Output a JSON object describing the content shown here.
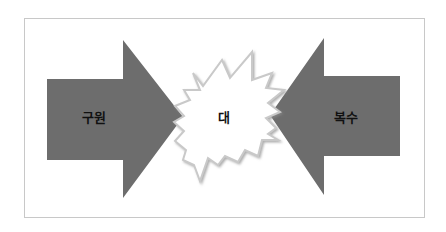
{
  "diagram": {
    "colors": {
      "arrow_fill": "#6d6d6d",
      "burst_fill": "#ffffff",
      "burst_stroke": "#c9c9c9",
      "burst_shadow": "#9a9a9a",
      "frame_border": "#c8c8c8",
      "text": "#111111"
    },
    "left_arrow": {
      "label": "구원",
      "direction": "right",
      "points": "47,79 123,79 123,40 183,117 123,198 123,160 47,160"
    },
    "right_arrow": {
      "label": "복수",
      "direction": "left",
      "points": "400,76 324,76 324,38 270,115 324,195 324,156 400,156"
    },
    "center_burst": {
      "label": "대",
      "points": "193,73 203,86 222,60 230,78 252,52 252,80 272,73 266,88 284,90 268,103 280,112 266,118 276,128 268,134 278,140 262,140 258,156 245,150 238,162 225,156 218,165 208,158 200,181 194,165 183,160 186,150 175,141 184,131 174,122 184,116 175,106 190,100 184,90 200,90"
    }
  }
}
